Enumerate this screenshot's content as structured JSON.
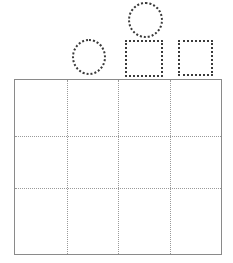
{
  "worksheet": {
    "title": "Shape tracing worksheet",
    "background_color": "#ffffff",
    "width": 233,
    "height": 263
  },
  "trace_shapes": {
    "stroke_style": "dotted",
    "stroke_color": "#3a3a3a",
    "stroke_width": 2,
    "items": [
      {
        "name": "circle-top",
        "shape": "circle",
        "label": "Circle",
        "x": 128,
        "y": 2,
        "width": 35,
        "height": 36
      },
      {
        "name": "circle-left",
        "shape": "circle",
        "label": "Circle",
        "x": 72,
        "y": 39,
        "width": 34,
        "height": 36
      },
      {
        "name": "square-middle",
        "shape": "square",
        "label": "Square",
        "x": 125,
        "y": 40,
        "width": 38,
        "height": 37
      },
      {
        "name": "square-right",
        "shape": "square",
        "label": "Square",
        "x": 178,
        "y": 40,
        "width": 35,
        "height": 36
      }
    ]
  },
  "grid": {
    "name": "tracing-grid",
    "x": 14,
    "y": 79,
    "width": 208,
    "height": 176,
    "columns": 4,
    "rows": 3,
    "border_color": "#8a8a8a",
    "border_width": 1.5,
    "gridline_color": "#9a9a9a",
    "gridline_style": "dotted",
    "vertical_lines": [
      52,
      103,
      155
    ],
    "horizontal_lines": [
      56,
      108
    ],
    "cells": [
      {
        "row": 0,
        "col": 0,
        "content": ""
      },
      {
        "row": 0,
        "col": 1,
        "content": ""
      },
      {
        "row": 0,
        "col": 2,
        "content": ""
      },
      {
        "row": 0,
        "col": 3,
        "content": ""
      },
      {
        "row": 1,
        "col": 0,
        "content": ""
      },
      {
        "row": 1,
        "col": 1,
        "content": ""
      },
      {
        "row": 1,
        "col": 2,
        "content": ""
      },
      {
        "row": 1,
        "col": 3,
        "content": ""
      },
      {
        "row": 2,
        "col": 0,
        "content": ""
      },
      {
        "row": 2,
        "col": 1,
        "content": ""
      },
      {
        "row": 2,
        "col": 2,
        "content": ""
      },
      {
        "row": 2,
        "col": 3,
        "content": ""
      }
    ]
  }
}
